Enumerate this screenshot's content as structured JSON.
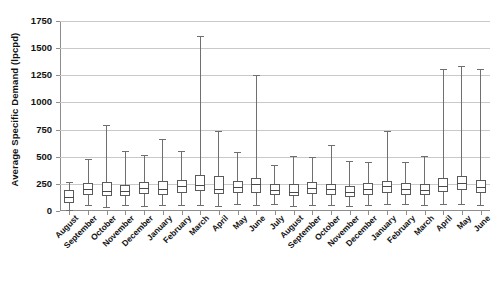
{
  "chart_data": {
    "type": "boxplot",
    "title": "",
    "xlabel": "",
    "ylabel": "Average Specific Demand (lpcpd)",
    "ylim": [
      0,
      1750
    ],
    "yticks": [
      0,
      250,
      500,
      750,
      1000,
      1250,
      1500,
      1750
    ],
    "grid": true,
    "legend": "none",
    "categories": [
      "August",
      "September",
      "October",
      "November",
      "December",
      "January",
      "February",
      "March",
      "April",
      "May",
      "June",
      "July",
      "August",
      "September",
      "October",
      "November",
      "December",
      "January",
      "February",
      "March",
      "April",
      "May",
      "June"
    ],
    "boxes": [
      {
        "category": "August",
        "whisker_low": 10,
        "q1": 75,
        "median": 125,
        "q3": 190,
        "whisker_high": 265
      },
      {
        "category": "September",
        "whisker_low": 55,
        "q1": 150,
        "median": 200,
        "q3": 255,
        "whisker_high": 480
      },
      {
        "category": "October",
        "whisker_low": 40,
        "q1": 140,
        "median": 185,
        "q3": 265,
        "whisker_high": 790
      },
      {
        "category": "November",
        "whisker_low": 55,
        "q1": 140,
        "median": 180,
        "q3": 240,
        "whisker_high": 555
      },
      {
        "category": "December",
        "whisker_low": 50,
        "q1": 155,
        "median": 215,
        "q3": 265,
        "whisker_high": 520
      },
      {
        "category": "January",
        "whisker_low": 55,
        "q1": 145,
        "median": 200,
        "q3": 275,
        "whisker_high": 665
      },
      {
        "category": "February",
        "whisker_low": 55,
        "q1": 165,
        "median": 230,
        "q3": 285,
        "whisker_high": 555
      },
      {
        "category": "March",
        "whisker_low": 55,
        "q1": 180,
        "median": 235,
        "q3": 330,
        "whisker_high": 1615
      },
      {
        "category": "April",
        "whisker_low": 50,
        "q1": 155,
        "median": 205,
        "q3": 320,
        "whisker_high": 740
      },
      {
        "category": "May",
        "whisker_low": 60,
        "q1": 165,
        "median": 225,
        "q3": 275,
        "whisker_high": 545
      },
      {
        "category": "June",
        "whisker_low": 55,
        "q1": 170,
        "median": 245,
        "q3": 300,
        "whisker_high": 1250
      },
      {
        "category": "July",
        "whisker_low": 60,
        "q1": 150,
        "median": 195,
        "q3": 245,
        "whisker_high": 425
      },
      {
        "category": "August",
        "whisker_low": 45,
        "q1": 140,
        "median": 175,
        "q3": 245,
        "whisker_high": 510
      },
      {
        "category": "September",
        "whisker_low": 55,
        "q1": 155,
        "median": 215,
        "q3": 265,
        "whisker_high": 500
      },
      {
        "category": "October",
        "whisker_low": 55,
        "q1": 150,
        "median": 205,
        "q3": 250,
        "whisker_high": 610
      },
      {
        "category": "November",
        "whisker_low": 50,
        "q1": 130,
        "median": 175,
        "q3": 230,
        "whisker_high": 460
      },
      {
        "category": "December",
        "whisker_low": 55,
        "q1": 150,
        "median": 200,
        "q3": 255,
        "whisker_high": 450
      },
      {
        "category": "January",
        "whisker_low": 60,
        "q1": 165,
        "median": 230,
        "q3": 280,
        "whisker_high": 740
      },
      {
        "category": "February",
        "whisker_low": 60,
        "q1": 150,
        "median": 200,
        "q3": 260,
        "whisker_high": 450
      },
      {
        "category": "March",
        "whisker_low": 55,
        "q1": 150,
        "median": 195,
        "q3": 245,
        "whisker_high": 510
      },
      {
        "category": "April",
        "whisker_low": 60,
        "q1": 175,
        "median": 230,
        "q3": 300,
        "whisker_high": 1310
      },
      {
        "category": "May",
        "whisker_low": 60,
        "q1": 190,
        "median": 260,
        "q3": 320,
        "whisker_high": 1335
      },
      {
        "category": "June",
        "whisker_low": 55,
        "q1": 170,
        "median": 225,
        "q3": 285,
        "whisker_high": 1305
      }
    ],
    "colors": {
      "box_stroke": "#5a5a5a",
      "whisker": "#6f6f6f",
      "gridline": "#c9c9c9",
      "axis": "#8d8d8d",
      "text": "#121212",
      "background": "#ffffff"
    }
  }
}
